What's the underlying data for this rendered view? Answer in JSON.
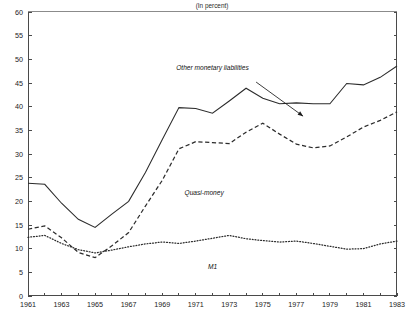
{
  "chart_data": {
    "type": "line",
    "title": "(In percent)",
    "xlabel": "",
    "ylabel": "",
    "xlim": [
      1961,
      1983
    ],
    "ylim": [
      0,
      60
    ],
    "ytick_step": 5,
    "xtick_step": 1,
    "xtick_label_step": 2,
    "grid": false,
    "legend": "inline-annotations",
    "x": [
      1961,
      1962,
      1963,
      1964,
      1965,
      1966,
      1967,
      1968,
      1969,
      1970,
      1971,
      1972,
      1973,
      1974,
      1975,
      1976,
      1977,
      1978,
      1979,
      1980,
      1981,
      1982,
      1983
    ],
    "yticks": [
      0,
      5,
      10,
      15,
      20,
      25,
      30,
      35,
      40,
      45,
      50,
      55,
      60
    ],
    "xticks": [
      1961,
      1962,
      1963,
      1964,
      1965,
      1966,
      1967,
      1968,
      1969,
      1970,
      1971,
      1972,
      1973,
      1974,
      1975,
      1976,
      1977,
      1978,
      1979,
      1980,
      1981,
      1982,
      1983
    ],
    "xtick_labels": [
      "1961",
      "",
      "1963",
      "",
      "1965",
      "",
      "1967",
      "",
      "1969",
      "",
      "1971",
      "",
      "1973",
      "",
      "1975",
      "",
      "1977",
      "",
      "1979",
      "",
      "1981",
      "",
      "1983"
    ],
    "series": [
      {
        "name": "Other monetary liabilities",
        "style": "solid",
        "label_x": 1972.0,
        "label_y": 47.8,
        "arrow_from_x": 1974.6,
        "arrow_from_y": 45.2,
        "arrow_to_x": 1977.4,
        "arrow_to_y": 38.0,
        "values": [
          23.8,
          23.6,
          19.6,
          16.2,
          14.5,
          17.3,
          20.0,
          26.1,
          33.0,
          39.8,
          39.6,
          38.6,
          41.2,
          43.9,
          41.8,
          40.6,
          40.8,
          40.6,
          40.6,
          44.9,
          44.6,
          46.2,
          48.6
        ]
      },
      {
        "name": "Quasi-money",
        "style": "dashed",
        "label_x": 1971.5,
        "label_y": 21.3,
        "values": [
          14.1,
          14.8,
          12.3,
          9.2,
          8.1,
          10.6,
          13.4,
          19.0,
          24.4,
          31.1,
          32.6,
          32.4,
          32.2,
          34.6,
          36.5,
          34.2,
          32.1,
          31.3,
          31.7,
          33.6,
          35.7,
          37.1,
          38.9
        ]
      },
      {
        "name": "M1",
        "style": "dotted",
        "label_x": 1972.0,
        "label_y": 5.6,
        "values": [
          12.4,
          12.8,
          11.1,
          9.8,
          9.1,
          9.7,
          10.4,
          11.0,
          11.4,
          11.1,
          11.6,
          12.2,
          12.8,
          12.1,
          11.7,
          11.4,
          11.6,
          11.1,
          10.5,
          9.9,
          10.0,
          11.0,
          11.6
        ]
      }
    ]
  },
  "plot_geometry": {
    "left": 28,
    "right": 397,
    "top": 12,
    "bottom": 296
  }
}
